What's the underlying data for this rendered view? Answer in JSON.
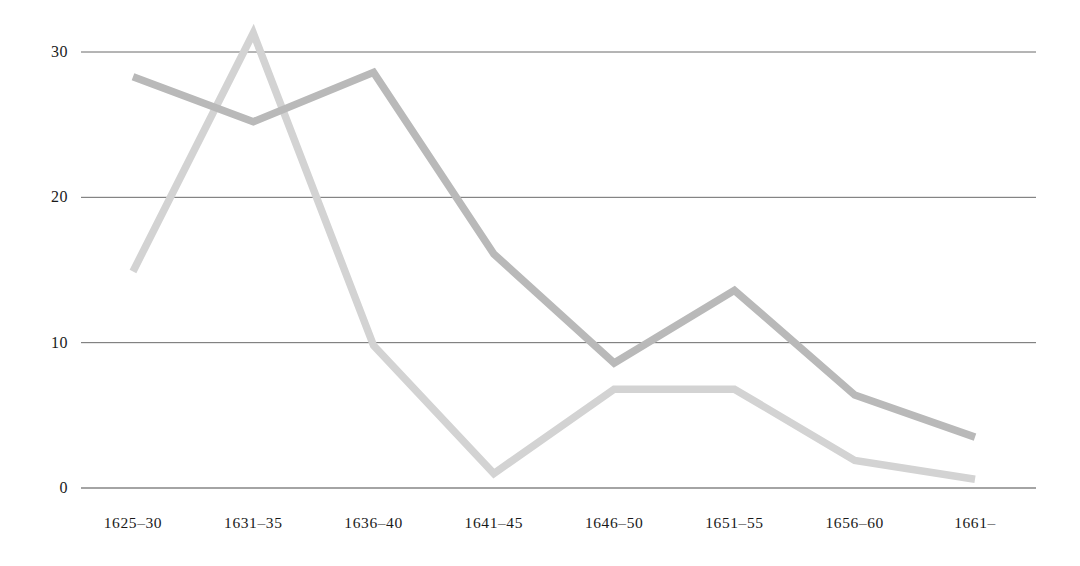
{
  "chart_data": {
    "type": "line",
    "title": "",
    "subtitle": "",
    "xlabel": "",
    "ylabel": "",
    "categories": [
      "1625–30",
      "1631–35",
      "1636–40",
      "1641–45",
      "1646–50",
      "1651–55",
      "1656–60",
      "1661–"
    ],
    "ytick_labels": [
      "0",
      "10",
      "20",
      "30"
    ],
    "ytick_values": [
      0,
      10,
      20,
      30
    ],
    "ylim": [
      0,
      33
    ],
    "xlim_index": [
      0,
      7
    ],
    "grid": "horizontal",
    "legend": "none",
    "annotations": [],
    "series": [
      {
        "name": "series-dark",
        "color": "#b9b9b9",
        "values": [
          28.3,
          25.2,
          28.6,
          16.1,
          8.6,
          13.6,
          6.4,
          3.5
        ]
      },
      {
        "name": "series-light",
        "color": "#d3d3d3",
        "values": [
          14.9,
          31.3,
          9.8,
          1.0,
          6.8,
          6.8,
          1.9,
          0.6
        ]
      }
    ]
  },
  "axes": {
    "baseline_color": "#4a4a4a",
    "gridline_color": "#5a5a5a",
    "background": "#ffffff"
  }
}
